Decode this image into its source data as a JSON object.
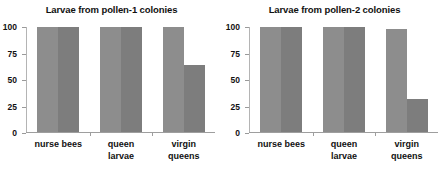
{
  "figure": {
    "background_color": "#ffffff",
    "panel_count": 2
  },
  "chart_data": [
    {
      "type": "bar",
      "title": "Larvae from pollen-1 colonies",
      "xlabel": "",
      "ylabel": "",
      "categories": [
        "nurse bees",
        "queen\nlarvae",
        "virgin\nqueens"
      ],
      "tick_labels": [
        "100",
        "75",
        "50",
        "25",
        "0"
      ],
      "ticks": [
        100,
        75,
        50,
        25,
        0
      ],
      "ylim": [
        0,
        100
      ],
      "grid": false,
      "legend": "none",
      "series": [
        {
          "name": "series-1",
          "color": "#8d8d8d",
          "values": [
            100,
            100,
            100
          ]
        },
        {
          "name": "series-2",
          "color": "#7d7d7d",
          "values": [
            100,
            100,
            64
          ]
        }
      ]
    },
    {
      "type": "bar",
      "title": "Larvae from pollen-2 colonies",
      "xlabel": "",
      "ylabel": "",
      "categories": [
        "nurse bees",
        "queen\nlarvae",
        "virgin\nqueens"
      ],
      "tick_labels": [
        "100",
        "75",
        "50",
        "25",
        "0"
      ],
      "ticks": [
        100,
        75,
        50,
        25,
        0
      ],
      "ylim": [
        0,
        100
      ],
      "grid": false,
      "legend": "none",
      "series": [
        {
          "name": "series-1",
          "color": "#8d8d8d",
          "values": [
            100,
            100,
            98
          ]
        },
        {
          "name": "series-2",
          "color": "#7d7d7d",
          "values": [
            100,
            100,
            31
          ]
        }
      ]
    }
  ]
}
